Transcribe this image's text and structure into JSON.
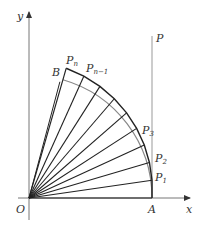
{
  "diagram": {
    "axes": {
      "x_label": "x",
      "y_label": "y",
      "origin_label": "O"
    },
    "points": {
      "A": "A",
      "B": "B",
      "P": "P",
      "P1": {
        "main": "P",
        "sub": "1"
      },
      "P2": {
        "main": "P",
        "sub": "2"
      },
      "P3": {
        "main": "P",
        "sub": "3"
      },
      "Pn": {
        "main": "P",
        "sub": "n"
      },
      "Pn1": {
        "main": "P",
        "sub": "n−1"
      }
    },
    "colors": {
      "axis": "#777777",
      "line": "#222222",
      "arc": "#888888"
    }
  }
}
